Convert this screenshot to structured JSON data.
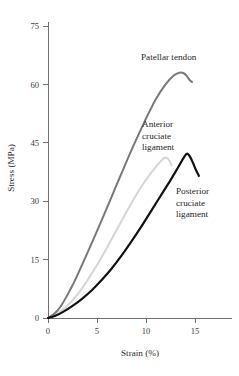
{
  "chart_data": {
    "type": "line",
    "title": "",
    "xlabel": "Strain (%)",
    "ylabel": "Stress (MPa)",
    "xlim": [
      0,
      17
    ],
    "ylim": [
      0,
      75
    ],
    "xticks": [
      "0",
      "5",
      "10",
      "15"
    ],
    "xtick_values": [
      0,
      5,
      10,
      15
    ],
    "yticks": [
      "0",
      "15",
      "30",
      "45",
      "60",
      "75"
    ],
    "ytick_values": [
      0,
      15,
      30,
      45,
      60,
      75
    ],
    "grid": false,
    "legend": "inline-annotations",
    "series": [
      {
        "name": "Patellar tendon",
        "color": "#787878",
        "stroke_width": 2.0,
        "points": [
          [
            0.0,
            0.0
          ],
          [
            0.5,
            0.8
          ],
          [
            1.0,
            2.0
          ],
          [
            1.5,
            3.8
          ],
          [
            2.0,
            6.0
          ],
          [
            2.5,
            8.4
          ],
          [
            3.0,
            11.0
          ],
          [
            4.0,
            16.6
          ],
          [
            5.0,
            22.3
          ],
          [
            6.0,
            28.2
          ],
          [
            7.0,
            34.2
          ],
          [
            8.0,
            40.1
          ],
          [
            9.0,
            45.8
          ],
          [
            10.0,
            51.2
          ],
          [
            11.0,
            56.2
          ],
          [
            12.0,
            60.0
          ],
          [
            12.8,
            62.2
          ],
          [
            13.4,
            63.0
          ],
          [
            13.9,
            62.8
          ],
          [
            14.2,
            62.0
          ],
          [
            14.5,
            61.0
          ],
          [
            14.7,
            60.6
          ]
        ]
      },
      {
        "name": "Anterior cruciate ligament",
        "color": "#d5d5d5",
        "stroke_width": 2.0,
        "points": [
          [
            0.0,
            0.0
          ],
          [
            0.6,
            0.6
          ],
          [
            1.2,
            1.6
          ],
          [
            2.0,
            3.2
          ],
          [
            3.0,
            6.0
          ],
          [
            4.0,
            9.6
          ],
          [
            5.0,
            13.6
          ],
          [
            6.0,
            18.0
          ],
          [
            7.0,
            22.6
          ],
          [
            8.0,
            27.2
          ],
          [
            9.0,
            31.6
          ],
          [
            10.0,
            35.5
          ],
          [
            10.8,
            38.2
          ],
          [
            11.4,
            40.0
          ],
          [
            11.8,
            41.0
          ],
          [
            12.1,
            41.2
          ],
          [
            12.4,
            40.4
          ],
          [
            12.6,
            39.2
          ]
        ]
      },
      {
        "name": "Posterior cruciate ligament",
        "color": "#121212",
        "stroke_width": 2.2,
        "points": [
          [
            0.0,
            0.0
          ],
          [
            0.7,
            0.5
          ],
          [
            1.5,
            1.5
          ],
          [
            2.5,
            3.1
          ],
          [
            3.5,
            5.0
          ],
          [
            4.5,
            7.2
          ],
          [
            5.5,
            9.8
          ],
          [
            6.5,
            12.7
          ],
          [
            7.5,
            16.0
          ],
          [
            8.5,
            19.6
          ],
          [
            9.5,
            23.4
          ],
          [
            10.5,
            27.4
          ],
          [
            11.5,
            31.4
          ],
          [
            12.5,
            35.4
          ],
          [
            13.3,
            38.8
          ],
          [
            13.9,
            41.4
          ],
          [
            14.2,
            42.2
          ],
          [
            14.5,
            41.4
          ],
          [
            14.8,
            39.8
          ],
          [
            15.1,
            38.0
          ],
          [
            15.4,
            36.5
          ]
        ]
      }
    ],
    "annotations": [
      {
        "name": "Patellar tendon",
        "lines": [
          "Patellar tendon"
        ],
        "x_px": 141,
        "y_px": 60,
        "anchor": "start"
      },
      {
        "name": "Anterior cruciate ligament",
        "lines": [
          "Anterior",
          "cruciate",
          "ligament"
        ],
        "x_px": 142,
        "y_px": 127,
        "anchor": "start"
      },
      {
        "name": "Posterior cruciate ligament",
        "lines": [
          "Posterior",
          "cruciate",
          "ligament"
        ],
        "x_px": 176,
        "y_px": 194,
        "anchor": "start"
      }
    ]
  },
  "axes": {
    "x_axis_title": "Strain (%)",
    "y_axis_title": "Stress (MPa)",
    "axis_color": "#6f6f6f"
  },
  "geometry": {
    "origin_x": 48,
    "origin_y": 318,
    "x_per_unit": 9.8,
    "y_per_unit": 3.8933,
    "y_top": 26,
    "x_right": 232
  }
}
